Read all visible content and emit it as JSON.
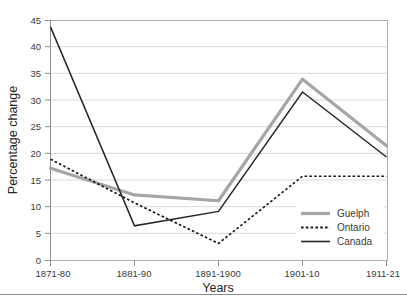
{
  "chart_data": {
    "type": "line",
    "title": "",
    "xlabel": "Years",
    "ylabel": "Percentage change",
    "categories": [
      "1871-80",
      "1881-90",
      "1891-1900",
      "1901-10",
      "1911-21"
    ],
    "ylim": [
      0,
      45
    ],
    "yticks": [
      0,
      5,
      10,
      15,
      20,
      25,
      30,
      35,
      40,
      45
    ],
    "grid": true,
    "legend_position": "inside-bottom-right",
    "series": [
      {
        "name": "Guelph",
        "values": [
          17.3,
          12.3,
          11.2,
          34.0,
          21.5
        ],
        "color": "#a6a6a6",
        "style": "solid-thick"
      },
      {
        "name": "Ontario",
        "values": [
          19.0,
          10.8,
          3.2,
          15.8,
          15.8
        ],
        "color": "#1a1a1a",
        "style": "dotted"
      },
      {
        "name": "Canada",
        "values": [
          43.8,
          6.5,
          9.2,
          31.6,
          19.4
        ],
        "color": "#262626",
        "style": "solid-thin"
      }
    ]
  },
  "axis": {
    "y_title": "Percentage change",
    "x_title": "Years",
    "y_tick_labels": [
      "45",
      "40",
      "35",
      "30",
      "25",
      "20",
      "15",
      "10",
      "5",
      "0"
    ],
    "x_tick_labels": [
      "1871-80",
      "1881-90",
      "1891-1900",
      "1901-10",
      "1911-21"
    ]
  },
  "legend": {
    "items": [
      {
        "label": "Guelph"
      },
      {
        "label": "Ontario"
      },
      {
        "label": "Canada"
      }
    ]
  },
  "colors": {
    "guelph": "#a6a6a6",
    "ontario": "#1a1a1a",
    "canada": "#262626",
    "grid": "#d9d9d9",
    "frame": "#b0b0b0",
    "text": "#3a3a3a"
  }
}
